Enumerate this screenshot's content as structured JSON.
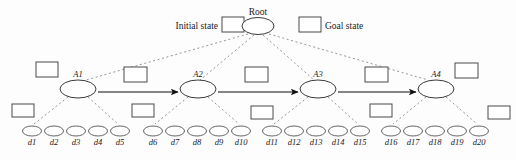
{
  "diagram": {
    "title_root": "Root",
    "legend": {
      "initial_state_label": "Initial state",
      "goal_state_label": "Goal state"
    },
    "colors": {
      "background": "#fdfdfd",
      "node_stroke": "#3a3a3a",
      "leaf_stroke": "#555555",
      "box_stroke": "#4a4a4a",
      "dotted_edge": "#8a8a8a",
      "arrow": "#111111",
      "text": "#1a1a1a"
    },
    "root_node": {
      "label": "Root",
      "cx": 258,
      "cy": 26,
      "rx": 16,
      "ry": 8.5
    },
    "action_nodes": [
      {
        "label": "A1",
        "cx": 78,
        "cy": 89,
        "rx": 18,
        "ry": 9
      },
      {
        "label": "A2",
        "cx": 198,
        "cy": 89,
        "rx": 18,
        "ry": 9
      },
      {
        "label": "A3",
        "cx": 318,
        "cy": 89,
        "rx": 18,
        "ry": 9
      },
      {
        "label": "A4",
        "cx": 436,
        "cy": 89,
        "rx": 18,
        "ry": 9
      }
    ],
    "leaf_nodes": [
      {
        "label": "d1",
        "cx": 32,
        "cy": 131
      },
      {
        "label": "d2",
        "cx": 54,
        "cy": 131
      },
      {
        "label": "d3",
        "cx": 76,
        "cy": 131
      },
      {
        "label": "d4",
        "cx": 98,
        "cy": 131
      },
      {
        "label": "d5",
        "cx": 120,
        "cy": 131
      },
      {
        "label": "d6",
        "cx": 153,
        "cy": 131
      },
      {
        "label": "d7",
        "cx": 175,
        "cy": 131
      },
      {
        "label": "d8",
        "cx": 197,
        "cy": 131
      },
      {
        "label": "d9",
        "cx": 219,
        "cy": 131
      },
      {
        "label": "d10",
        "cx": 241,
        "cy": 131
      },
      {
        "label": "d11",
        "cx": 272,
        "cy": 131
      },
      {
        "label": "d12",
        "cx": 294,
        "cy": 131
      },
      {
        "label": "d13",
        "cx": 316,
        "cy": 131
      },
      {
        "label": "d14",
        "cx": 338,
        "cy": 131
      },
      {
        "label": "d15",
        "cx": 360,
        "cy": 131
      },
      {
        "label": "d16",
        "cx": 391,
        "cy": 131
      },
      {
        "label": "d17",
        "cx": 413,
        "cy": 131
      },
      {
        "label": "d18",
        "cx": 435,
        "cy": 131
      },
      {
        "label": "d19",
        "cx": 457,
        "cy": 131
      },
      {
        "label": "d20",
        "cx": 479,
        "cy": 131
      }
    ],
    "state_boxes": [
      {
        "name": "legend-initial-state-box",
        "x": 222,
        "y": 17,
        "w": 22,
        "h": 15
      },
      {
        "name": "legend-goal-state-box",
        "x": 299,
        "y": 17,
        "w": 22,
        "h": 15
      },
      {
        "name": "state-box-a1-left",
        "x": 36,
        "y": 62,
        "w": 22,
        "h": 15
      },
      {
        "name": "state-box-a1-a2",
        "x": 124,
        "y": 67,
        "w": 23,
        "h": 15
      },
      {
        "name": "state-box-a2-a3",
        "x": 245,
        "y": 67,
        "w": 23,
        "h": 15
      },
      {
        "name": "state-box-a3-a4",
        "x": 365,
        "y": 67,
        "w": 23,
        "h": 15
      },
      {
        "name": "state-box-a4-right",
        "x": 455,
        "y": 63,
        "w": 23,
        "h": 15
      },
      {
        "name": "state-box-d1-left",
        "x": 12,
        "y": 104,
        "w": 22,
        "h": 13
      },
      {
        "name": "state-box-d6-left",
        "x": 132,
        "y": 104,
        "w": 22,
        "h": 13
      },
      {
        "name": "state-box-d11-left",
        "x": 251,
        "y": 106,
        "w": 22,
        "h": 13
      },
      {
        "name": "state-box-d16-left",
        "x": 370,
        "y": 104,
        "w": 22,
        "h": 13
      },
      {
        "name": "state-box-d20-right",
        "x": 488,
        "y": 106,
        "w": 22,
        "h": 13
      }
    ],
    "root_edges": [
      {
        "name": "root-edge-a1",
        "x1": 248,
        "y1": 34,
        "x2": 86,
        "y2": 80
      },
      {
        "name": "root-edge-a2",
        "x1": 254,
        "y1": 35,
        "x2": 200,
        "y2": 80
      },
      {
        "name": "root-edge-a3",
        "x1": 263,
        "y1": 35,
        "x2": 314,
        "y2": 80
      },
      {
        "name": "root-edge-a4",
        "x1": 269,
        "y1": 34,
        "x2": 428,
        "y2": 80
      }
    ],
    "transition_arrows": [
      {
        "name": "arrow-a1-a2",
        "x1": 98,
        "y1": 92,
        "x2": 178,
        "y2": 92
      },
      {
        "name": "arrow-a2-a3",
        "x1": 218,
        "y1": 92,
        "x2": 298,
        "y2": 92
      },
      {
        "name": "arrow-a3-a4",
        "x1": 338,
        "y1": 92,
        "x2": 416,
        "y2": 92
      }
    ],
    "leaf_edges": [
      {
        "name": "leaf-edge-a1-d1",
        "x1": 68,
        "y1": 97,
        "x2": 34,
        "y2": 124
      },
      {
        "name": "leaf-edge-a1-d5",
        "x1": 88,
        "y1": 97,
        "x2": 118,
        "y2": 124
      },
      {
        "name": "leaf-edge-a2-d6",
        "x1": 188,
        "y1": 97,
        "x2": 155,
        "y2": 124
      },
      {
        "name": "leaf-edge-a2-d10",
        "x1": 208,
        "y1": 97,
        "x2": 239,
        "y2": 124
      },
      {
        "name": "leaf-edge-a3-d11",
        "x1": 308,
        "y1": 97,
        "x2": 274,
        "y2": 124
      },
      {
        "name": "leaf-edge-a3-d15",
        "x1": 328,
        "y1": 97,
        "x2": 358,
        "y2": 124
      },
      {
        "name": "leaf-edge-a4-d16",
        "x1": 426,
        "y1": 97,
        "x2": 393,
        "y2": 124
      },
      {
        "name": "leaf-edge-a4-d20",
        "x1": 446,
        "y1": 97,
        "x2": 477,
        "y2": 124
      }
    ]
  }
}
